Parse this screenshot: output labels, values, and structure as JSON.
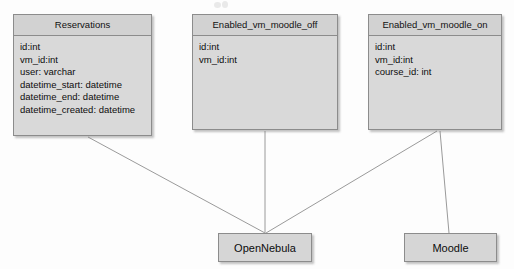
{
  "diagram": {
    "background_color": "#fdfdfd",
    "entity_fill": "#d9d9d9",
    "entity_header_fill": "#d2d2d2",
    "entity_border": "#8c8c8c",
    "edge_color": "#9a9a9a",
    "entities": [
      {
        "id": "reservations",
        "name": "Reservations",
        "x": 13,
        "y": 14,
        "width": 139,
        "height": 122,
        "attributes": [
          "id:int",
          "vm_id:int",
          "user: varchar",
          "datetime_start: datetime",
          "datetime_end: datetime",
          "datetime_created: datetime"
        ]
      },
      {
        "id": "enabled_vm_moodle_off",
        "name": "Enabled_vm_moodle_off",
        "x": 192,
        "y": 14,
        "width": 146,
        "height": 116,
        "attributes": [
          "id:int",
          "vm_id:int"
        ]
      },
      {
        "id": "enabled_vm_moodle_on",
        "name": "Enabled_vm_moodle_on",
        "x": 368,
        "y": 14,
        "width": 134,
        "height": 116,
        "attributes": [
          "id:int",
          "vm_id:int",
          "course_id: int"
        ]
      }
    ],
    "nodes": [
      {
        "id": "opennebula",
        "label": "OpenNebula",
        "x": 218,
        "y": 233,
        "width": 94,
        "height": 29
      },
      {
        "id": "moodle",
        "label": "Moodle",
        "x": 404,
        "y": 233,
        "width": 93,
        "height": 29
      }
    ],
    "edges": [
      {
        "id": "reservations-to-opennebula",
        "from": "reservations",
        "to": "opennebula",
        "x1": 88,
        "y1": 137,
        "x2": 265,
        "y2": 233
      },
      {
        "id": "enabled-off-to-opennebula",
        "from": "enabled_vm_moodle_off",
        "to": "opennebula",
        "x1": 265,
        "y1": 131,
        "x2": 265,
        "y2": 233
      },
      {
        "id": "enabled-on-to-opennebula",
        "from": "enabled_vm_moodle_on",
        "to": "opennebula",
        "x1": 437,
        "y1": 131,
        "x2": 266,
        "y2": 233
      },
      {
        "id": "enabled-on-to-moodle",
        "from": "enabled_vm_moodle_on",
        "to": "moodle",
        "x1": 440,
        "y1": 131,
        "x2": 449,
        "y2": 233
      }
    ]
  }
}
